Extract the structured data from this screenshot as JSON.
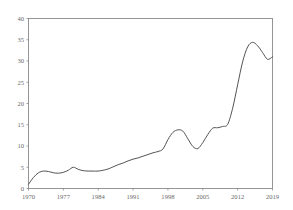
{
  "chart_data": {
    "type": "line",
    "title": "",
    "subtitle": "",
    "xlabel": "",
    "ylabel": "",
    "xlim": [
      1970,
      2019
    ],
    "ylim": [
      0,
      40
    ],
    "grid": false,
    "legend": null,
    "annotations": [],
    "x_ticks": [
      1970,
      1977,
      1984,
      1991,
      1998,
      2005,
      2012,
      2019
    ],
    "y_ticks": [
      0,
      5,
      10,
      15,
      20,
      25,
      30,
      35,
      40
    ],
    "x_tick_labels": [
      "1970",
      "1977",
      "1984",
      "1991",
      "1998",
      "2005",
      "2012",
      "2019"
    ],
    "y_tick_labels": [
      "0",
      "5",
      "10",
      "15",
      "20",
      "25",
      "30",
      "35",
      "40"
    ],
    "series": [
      {
        "name": "series-1",
        "color": "#4a4a4a",
        "x": [
          1970,
          1971,
          1972,
          1973,
          1974,
          1975,
          1976,
          1977,
          1978,
          1979,
          1980,
          1981,
          1982,
          1983,
          1984,
          1985,
          1986,
          1987,
          1988,
          1989,
          1990,
          1991,
          1992,
          1993,
          1994,
          1995,
          1996,
          1997,
          1998,
          1999,
          2000,
          2001,
          2002,
          2003,
          2004,
          2005,
          2006,
          2007,
          2008,
          2009,
          2010,
          2011,
          2012,
          2013,
          2014,
          2015,
          2016,
          2017,
          2018,
          2019
        ],
        "values": [
          1.0,
          2.6,
          3.7,
          4.1,
          4.0,
          3.7,
          3.6,
          3.8,
          4.3,
          5.0,
          4.5,
          4.2,
          4.1,
          4.1,
          4.1,
          4.3,
          4.6,
          5.1,
          5.6,
          6.0,
          6.5,
          6.9,
          7.2,
          7.6,
          8.0,
          8.4,
          8.7,
          9.3,
          11.5,
          13.2,
          13.8,
          13.5,
          11.7,
          9.9,
          9.4,
          10.8,
          12.7,
          14.2,
          14.3,
          14.6,
          15.1,
          18.9,
          24.4,
          29.8,
          33.3,
          34.4,
          33.6,
          32.0,
          30.4,
          31.0
        ]
      }
    ]
  },
  "axes": {
    "frame_color": "#8a8a8a",
    "tick_color": "#8a8a8a",
    "label_color": "#6b6b6b"
  }
}
